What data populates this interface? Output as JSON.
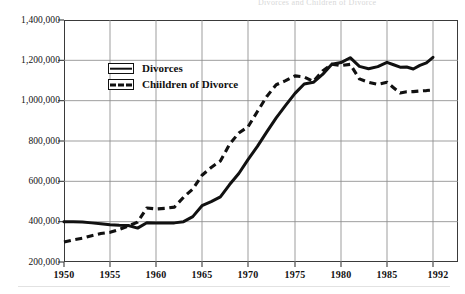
{
  "chart_data": {
    "type": "line",
    "title": "Divorces and Children of Divorce",
    "xlabel": "",
    "ylabel": "",
    "xlim": [
      1950,
      1992
    ],
    "ylim": [
      200000,
      1400000
    ],
    "grid": true,
    "legend_position": "inside-upper-left",
    "x_ticks": [
      1950,
      1955,
      1960,
      1965,
      1970,
      1975,
      1980,
      1985,
      1992
    ],
    "x_tick_labels": [
      "1950",
      "1955",
      "1960",
      "1965",
      "1970",
      "1975",
      "1980",
      "1985",
      "1992"
    ],
    "y_ticks": [
      200000,
      400000,
      600000,
      800000,
      1000000,
      1200000,
      1400000
    ],
    "y_tick_labels": [
      "200,000",
      "400,000",
      "600,000",
      "800,000",
      "1,000,000",
      "1,200,000",
      "1,400,000"
    ],
    "x": [
      1950,
      1951,
      1952,
      1953,
      1954,
      1955,
      1956,
      1957,
      1958,
      1959,
      1960,
      1961,
      1962,
      1963,
      1964,
      1965,
      1966,
      1967,
      1968,
      1969,
      1970,
      1971,
      1972,
      1973,
      1974,
      1975,
      1976,
      1977,
      1978,
      1979,
      1980,
      1981,
      1982,
      1983,
      1984,
      1985,
      1986,
      1987,
      1988,
      1989,
      1990,
      1991,
      1992
    ],
    "series": [
      {
        "name": "Divorces",
        "style": "solid",
        "color": "#111111",
        "values": [
          400000,
          399000,
          398000,
          394000,
          390000,
          385000,
          382000,
          381000,
          368000,
          395000,
          393000,
          393000,
          394000,
          400000,
          425000,
          479000,
          499000,
          523000,
          584000,
          639000,
          708000,
          773000,
          845000,
          915000,
          977000,
          1036000,
          1083000,
          1091000,
          1130000,
          1181000,
          1189000,
          1213000,
          1170000,
          1158000,
          1169000,
          1190000,
          1178000,
          1166000,
          1167000,
          1157000,
          1175000,
          1187000,
          1215000
        ]
      },
      {
        "name": "Chiildren of Divorce",
        "style": "dashed",
        "color": "#111111",
        "values": [
          299000,
          310000,
          318000,
          330000,
          341000,
          347000,
          361000,
          379000,
          398000,
          468000,
          463000,
          466000,
          472000,
          521000,
          562000,
          630000,
          669000,
          701000,
          784000,
          840000,
          870000,
          946000,
          1021000,
          1079000,
          1099000,
          1123000,
          1117000,
          1095000,
          1147000,
          1181000,
          1174000,
          1180000,
          1108000,
          1091000,
          1081000,
          1091000,
          1064000,
          1038000,
          1044000,
          1045000,
          1048000,
          1050000,
          1053000
        ]
      }
    ]
  },
  "legend": {
    "items": [
      {
        "label": "Divorces",
        "style": "solid"
      },
      {
        "label": "Chiildren of Divorce",
        "style": "dashed"
      }
    ]
  },
  "axes": {
    "y_labels": [
      "1,400,000",
      "1,200,000",
      "1,000,000",
      "800,000",
      "600,000",
      "400,000",
      "200,000"
    ],
    "x_labels": [
      "1950",
      "1955",
      "1960",
      "1965",
      "1970",
      "1975",
      "1980",
      "1985",
      "1992"
    ]
  }
}
